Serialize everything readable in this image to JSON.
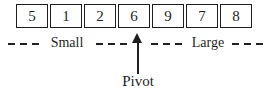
{
  "diagram": {
    "type": "quicksort-partition",
    "array": {
      "values": [
        "5",
        "1",
        "2",
        "6",
        "9",
        "7",
        "8"
      ],
      "pivot_index": 3,
      "pivot_value": "6"
    },
    "labels": {
      "small": "Small",
      "large": "Large",
      "pivot": "Pivot"
    },
    "colors": {
      "ink": "#1f1f1f",
      "background": "#ffffff"
    }
  }
}
